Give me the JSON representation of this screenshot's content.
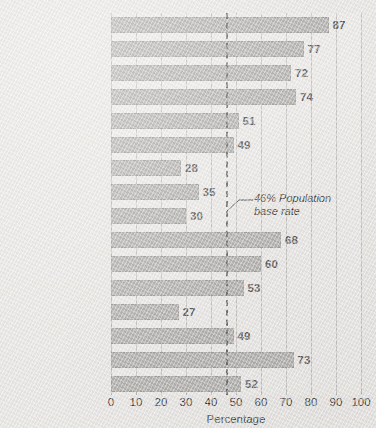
{
  "chart_data": {
    "type": "bar",
    "orientation": "horizontal",
    "title": "",
    "xlabel": "Percentage",
    "ylabel": "",
    "xlim": [
      0,
      100
    ],
    "xticks": [
      0,
      10,
      20,
      30,
      40,
      50,
      60,
      70,
      80,
      90,
      100
    ],
    "grid": true,
    "legend": null,
    "categories": [
      "Poetry",
      "Fiction",
      "Non-fiction",
      "Theatre",
      "Social sciences",
      "Social activism",
      "Natural sciences",
      "Public office",
      "Military",
      "Music performance",
      "Musical composing",
      "Sports",
      "Exploration",
      "Business",
      "Art",
      "Architecture"
    ],
    "values": [
      87,
      77,
      72,
      74,
      51,
      49,
      28,
      35,
      30,
      68,
      60,
      53,
      27,
      49,
      73,
      52
    ],
    "annotations": [
      {
        "name": "population-base-rate",
        "value": 46,
        "line_1": "46% Population",
        "line_2": "base rate",
        "style": "dashed-vertical-line"
      }
    ]
  },
  "colors": {
    "bar": "#b4b2af",
    "plot_background": "#eceae7",
    "page_background": "#e9e7e4",
    "gridline": "#c6c4c1",
    "value_label": "#5b5b5b",
    "baserate_line": "#6f6f6f",
    "text": "#3c3c3c"
  }
}
